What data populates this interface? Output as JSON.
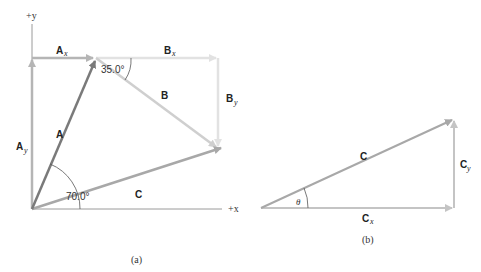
{
  "figure_a": {
    "caption": "(a)",
    "axes": {
      "x_label": "+x",
      "y_label": "+y"
    },
    "vectors": {
      "A": {
        "label": "A",
        "x_label": "A",
        "x_sub": "x",
        "y_label": "A",
        "y_sub": "y"
      },
      "B": {
        "label": "B",
        "x_label": "B",
        "x_sub": "x",
        "y_label": "B",
        "y_sub": "y"
      },
      "C": {
        "label": "C"
      }
    },
    "angles": {
      "A_angle": "70.0°",
      "B_angle": "35.0°"
    }
  },
  "figure_b": {
    "caption": "(b)",
    "vectors": {
      "C": {
        "label": "C",
        "x_label": "C",
        "x_sub": "x",
        "y_label": "C",
        "y_sub": "y"
      }
    },
    "angles": {
      "theta": "θ"
    }
  },
  "colors": {
    "axis": "#9a9a9a",
    "vector_A": "#7a7a7a",
    "components_A": "#b5b5b5",
    "vector_B": "#cfcfcf",
    "components_B": "#e2e2e2",
    "vector_C": "#a8a8a8",
    "components_C": "#c4c4c4",
    "text": "#222222"
  }
}
